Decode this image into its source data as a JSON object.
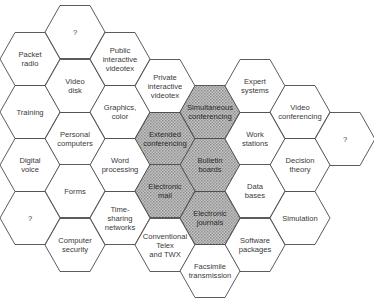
{
  "diagram": {
    "colors": {
      "line": "#4a4a4a",
      "text": "#3a3a3a",
      "shade": "#a8a8a8",
      "background": "#ffffff"
    },
    "hex_radius": 30,
    "cells": [
      {
        "id": "unknown-top",
        "lines": [
          "?"
        ],
        "cx": 75,
        "cy": 32,
        "shaded": false
      },
      {
        "id": "packet-radio",
        "lines": [
          "Packet",
          "radio"
        ],
        "cx": 30,
        "cy": 59,
        "shaded": false
      },
      {
        "id": "video-disk",
        "lines": [
          "Video",
          "disk"
        ],
        "cx": 75,
        "cy": 86,
        "shaded": false
      },
      {
        "id": "public-interactive-videotex",
        "lines": [
          "Public",
          "interactive",
          "videotex"
        ],
        "cx": 120,
        "cy": 59,
        "shaded": false
      },
      {
        "id": "training",
        "lines": [
          "Training"
        ],
        "cx": 30,
        "cy": 112,
        "shaded": false
      },
      {
        "id": "graphics-color",
        "lines": [
          "Graphics,",
          "color"
        ],
        "cx": 120,
        "cy": 112,
        "shaded": false
      },
      {
        "id": "private-interactive-videotex",
        "lines": [
          "Private",
          "interactive",
          "videotex"
        ],
        "cx": 165,
        "cy": 86,
        "shaded": false
      },
      {
        "id": "personal-computers",
        "lines": [
          "Personal",
          "computers"
        ],
        "cx": 75,
        "cy": 139,
        "shaded": false
      },
      {
        "id": "extended-conferencing",
        "lines": [
          "Extended",
          "conferencing"
        ],
        "cx": 165,
        "cy": 139,
        "shaded": true
      },
      {
        "id": "simultaneous-conferencing",
        "lines": [
          "Simultaneous",
          "conferencing"
        ],
        "cx": 210,
        "cy": 112,
        "shaded": true
      },
      {
        "id": "expert-systems",
        "lines": [
          "Expert",
          "systems"
        ],
        "cx": 255,
        "cy": 86,
        "shaded": false
      },
      {
        "id": "video-conferencing",
        "lines": [
          "Video",
          "conferencing"
        ],
        "cx": 300,
        "cy": 112,
        "shaded": false
      },
      {
        "id": "digital-voice",
        "lines": [
          "Digital",
          "voice"
        ],
        "cx": 30,
        "cy": 165,
        "shaded": false
      },
      {
        "id": "word-processing",
        "lines": [
          "Word",
          "processing"
        ],
        "cx": 120,
        "cy": 165,
        "shaded": false
      },
      {
        "id": "bulletin-boards",
        "lines": [
          "Bulletin",
          "boards"
        ],
        "cx": 210,
        "cy": 165,
        "shaded": true
      },
      {
        "id": "work-stations",
        "lines": [
          "Work",
          "stations"
        ],
        "cx": 255,
        "cy": 139,
        "shaded": false
      },
      {
        "id": "unknown-right",
        "lines": [
          "?"
        ],
        "cx": 345,
        "cy": 139,
        "shaded": false
      },
      {
        "id": "decision-theory",
        "lines": [
          "Decision",
          "theory"
        ],
        "cx": 300,
        "cy": 165,
        "shaded": false
      },
      {
        "id": "forms",
        "lines": [
          "Forms"
        ],
        "cx": 75,
        "cy": 191,
        "shaded": false
      },
      {
        "id": "electronic-mail",
        "lines": [
          "Electronic",
          "mail"
        ],
        "cx": 165,
        "cy": 191,
        "shaded": true
      },
      {
        "id": "data-bases",
        "lines": [
          "Data",
          "bases"
        ],
        "cx": 255,
        "cy": 191,
        "shaded": false
      },
      {
        "id": "unknown-bottom-left",
        "lines": [
          "?"
        ],
        "cx": 30,
        "cy": 218,
        "shaded": false
      },
      {
        "id": "time-sharing-networks",
        "lines": [
          "Time-",
          "sharing",
          "networks"
        ],
        "cx": 120,
        "cy": 218,
        "shaded": false
      },
      {
        "id": "electronic-journals",
        "lines": [
          "Electronic",
          "journals"
        ],
        "cx": 210,
        "cy": 218,
        "shaded": true
      },
      {
        "id": "simulation",
        "lines": [
          "Simulation"
        ],
        "cx": 300,
        "cy": 218,
        "shaded": false
      },
      {
        "id": "computer-security",
        "lines": [
          "Computer",
          "security"
        ],
        "cx": 75,
        "cy": 245,
        "shaded": false
      },
      {
        "id": "conventional-telex-twx",
        "lines": [
          "Conventional",
          "Telex",
          "and TWX"
        ],
        "cx": 165,
        "cy": 245,
        "shaded": false
      },
      {
        "id": "software-packages",
        "lines": [
          "Software",
          "packages"
        ],
        "cx": 255,
        "cy": 245,
        "shaded": false
      },
      {
        "id": "facsimile-transmission",
        "lines": [
          "Facsimile",
          "transmission"
        ],
        "cx": 210,
        "cy": 271,
        "shaded": false
      }
    ]
  }
}
